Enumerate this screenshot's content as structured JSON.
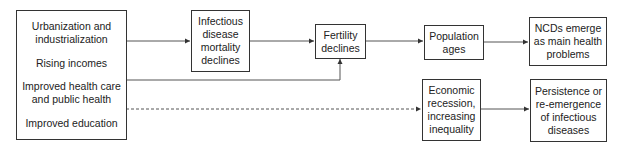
{
  "diagram": {
    "drivers": {
      "items": [
        "Urbanization and\nindustrialization",
        "Rising incomes",
        "Improved health care\nand public health",
        "Improved education"
      ]
    },
    "nodes": {
      "infectious_decline": "Infectious\ndisease\nmortality\ndeclines",
      "fertility": "Fertility\ndeclines",
      "population_ages": "Population\nages",
      "ncds": "NCDs emerge\nas main health\nproblems",
      "recession": "Economic\nrecession,\nincreasing\ninequality",
      "persistence": "Persistence or\nre-emergence\nof infectious\ndiseases"
    },
    "edges": [
      {
        "from": "drivers",
        "to": "infectious_decline",
        "style": "solid"
      },
      {
        "from": "infectious_decline",
        "to": "fertility",
        "style": "solid"
      },
      {
        "from": "drivers",
        "to": "fertility",
        "style": "solid"
      },
      {
        "from": "fertility",
        "to": "population_ages",
        "style": "solid"
      },
      {
        "from": "population_ages",
        "to": "ncds",
        "style": "solid"
      },
      {
        "from": "drivers",
        "to": "recession",
        "style": "dashed"
      },
      {
        "from": "recession",
        "to": "persistence",
        "style": "solid"
      }
    ]
  }
}
